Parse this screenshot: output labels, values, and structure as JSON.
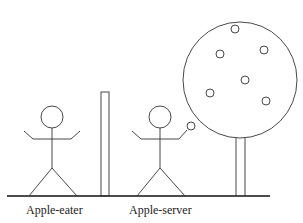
{
  "diagram": {
    "labels": {
      "apple_eater": "Apple-eater",
      "apple_server": "Apple-server"
    },
    "elements": {
      "figures": [
        "Apple-eater stick figure",
        "Apple-server stick figure holding apple"
      ],
      "barrier": "vertical post",
      "tree": "apple tree with 6 apples"
    },
    "colors": {
      "stroke": "#333333",
      "background": "#ffffff"
    }
  }
}
